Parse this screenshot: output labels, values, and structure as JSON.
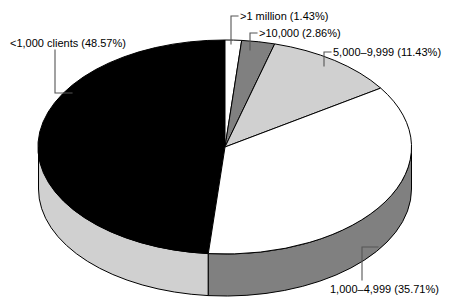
{
  "chart_data": {
    "type": "pie",
    "title": "",
    "subtitle": "",
    "xlabel": "",
    "ylabel": "",
    "legend_position": "none",
    "grid": false,
    "three_d": true,
    "start_angle_deg": 0,
    "direction": "clockwise",
    "categories": [
      ">1 million",
      ">10,000",
      "5,000–9,999",
      "1,000–4,999",
      "<1,000 clients"
    ],
    "values": [
      1.43,
      2.86,
      11.43,
      35.71,
      48.57
    ],
    "value_unit": "percent",
    "slices": [
      {
        "label": ">1 million (1.43%)",
        "category": ">1 million",
        "percent": 1.43,
        "fill": "#ffffff",
        "side_fill": "#ffffff",
        "stroke": "#000000"
      },
      {
        "label": ">10,000 (2.86%)",
        "category": ">10,000",
        "percent": 2.86,
        "fill": "#808080",
        "side_fill": "#6e6e6e",
        "stroke": "#000000"
      },
      {
        "label": "5,000–9,999 (11.43%)",
        "category": "5,000–9,999",
        "percent": 11.43,
        "fill": "#d0d0d0",
        "side_fill": "#b4b4b4",
        "stroke": "#000000"
      },
      {
        "label": "1,000–4,999 (35.71%)",
        "category": "1,000–4,999",
        "percent": 35.71,
        "fill": "#ffffff",
        "side_fill": "#808080",
        "stroke": "#000000"
      },
      {
        "label": "<1,000 clients (48.57%)",
        "category": "<1,000 clients",
        "percent": 48.57,
        "fill": "#000000",
        "side_fill": "#d0d0d0",
        "stroke": "#000000"
      }
    ],
    "colors": {
      "white": "#ffffff",
      "light_gray": "#d0d0d0",
      "dark_gray": "#808080",
      "black": "#000000",
      "outline": "#000000",
      "leader_line": "#555555"
    }
  },
  "labels": {
    "lt_1000": "<1,000 clients (48.57%)",
    "gt_1million": ">1 million (1.43%)",
    "gt_10000": ">10,000 (2.86%)",
    "r5000_9999": "5,000–9,999 (11.43%)",
    "r1000_4999": "1,000–4,999 (35.71%)"
  }
}
